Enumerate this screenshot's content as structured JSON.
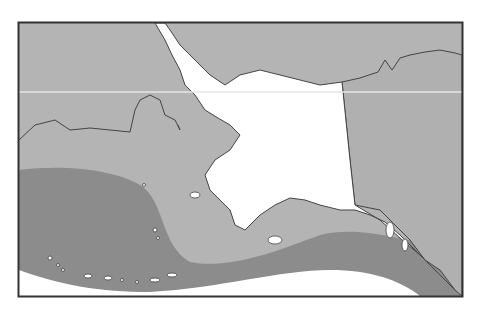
{
  "map": {
    "subject": "Alaska region map with shaded zones",
    "frame": {
      "x": 18,
      "y": 22,
      "width": 444,
      "height": 274
    },
    "colors": {
      "background": "#ffffff",
      "land_alaska": "#ffffff",
      "zone_light": "#b4b4b4",
      "zone_dark": "#8c8c8c",
      "land_other": "#b0b0b0",
      "border": "#333333",
      "latitude_line": "#e6e6e6",
      "ocean_south": "#ffffff"
    },
    "regions": [
      {
        "name": "russia-chukotka",
        "shade": "light"
      },
      {
        "name": "bering-sea-zone",
        "shade": "light"
      },
      {
        "name": "aleutian-gulf-zone",
        "shade": "dark"
      },
      {
        "name": "canada-yukon-bc",
        "shade": "light"
      },
      {
        "name": "alaska-mainland",
        "shade": "white"
      }
    ],
    "features": [
      "latitude-line",
      "aleutian-islands",
      "southeast-panhandle",
      "canada-border"
    ]
  }
}
